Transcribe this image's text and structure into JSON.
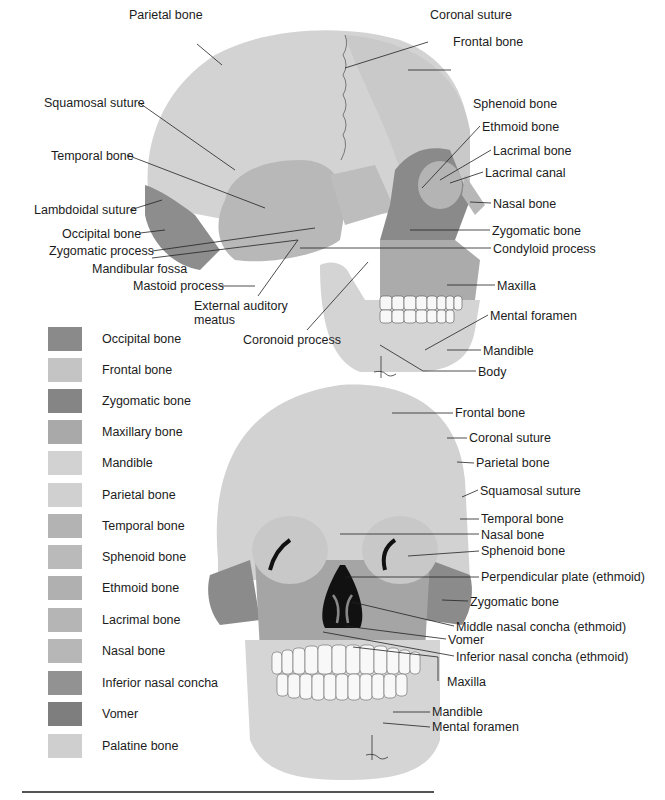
{
  "lateral_view": {
    "labels": [
      {
        "text": "Parietal bone",
        "x": 129,
        "y": 36
      },
      {
        "text": "Coronal suture",
        "x": 430,
        "y": 36
      },
      {
        "text": "Frontal bone",
        "x": 453,
        "y": 63
      },
      {
        "text": "Squamosal suture",
        "x": 44,
        "y": 96
      },
      {
        "text": "Sphenoid bone",
        "x": 473,
        "y": 97
      },
      {
        "text": "Ethmoid bone",
        "x": 482,
        "y": 120
      },
      {
        "text": "Temporal bone",
        "x": 51,
        "y": 149
      },
      {
        "text": "Lacrimal bone",
        "x": 493,
        "y": 144
      },
      {
        "text": "Lacrimal canal",
        "x": 485,
        "y": 166
      },
      {
        "text": "Lambdoidal suture",
        "x": 34,
        "y": 204
      },
      {
        "text": "Nasal bone",
        "x": 493,
        "y": 197
      },
      {
        "text": "Occipital bone",
        "x": 62,
        "y": 228
      },
      {
        "text": "Zygomatic bone",
        "x": 492,
        "y": 224
      },
      {
        "text": "Zygomatic process",
        "x": 49,
        "y": 245
      },
      {
        "text": "Condyloid process",
        "x": 493,
        "y": 242
      },
      {
        "text": "Mandibular fossa",
        "x": 92,
        "y": 263
      },
      {
        "text": "Mastoid process",
        "x": 133,
        "y": 280
      },
      {
        "text": "External auditory",
        "x": 194,
        "y": 300
      },
      {
        "text": "meatus",
        "x": 194,
        "y": 315
      },
      {
        "text": "Maxilla",
        "x": 497,
        "y": 279
      },
      {
        "text": "Mental foramen",
        "x": 490,
        "y": 309
      },
      {
        "text": "Coronoid process",
        "x": 243,
        "y": 333
      },
      {
        "text": "Mandible",
        "x": 483,
        "y": 344
      },
      {
        "text": "Body",
        "x": 478,
        "y": 365
      }
    ]
  },
  "frontal_view": {
    "labels": [
      {
        "text": "Frontal bone",
        "x": 455,
        "y": 406
      },
      {
        "text": "Coronal suture",
        "x": 469,
        "y": 431
      },
      {
        "text": "Parietal bone",
        "x": 476,
        "y": 456
      },
      {
        "text": "Squamosal suture",
        "x": 480,
        "y": 484
      },
      {
        "text": "Temporal bone",
        "x": 481,
        "y": 513
      },
      {
        "text": "Nasal bone",
        "x": 481,
        "y": 528
      },
      {
        "text": "Sphenoid bone",
        "x": 481,
        "y": 545
      },
      {
        "text": "Perpendicular plate (ethmoid)",
        "x": 481,
        "y": 571
      },
      {
        "text": "Zygomatic bone",
        "x": 470,
        "y": 595
      },
      {
        "text": "Middle nasal concha (ethmoid)",
        "x": 456,
        "y": 620
      },
      {
        "text": "Vomer",
        "x": 448,
        "y": 633
      },
      {
        "text": "Inferior nasal concha (ethmoid)",
        "x": 456,
        "y": 650
      },
      {
        "text": "Maxilla",
        "x": 447,
        "y": 675
      },
      {
        "text": "Mandible",
        "x": 432,
        "y": 705
      },
      {
        "text": "Mental foramen",
        "x": 432,
        "y": 720
      }
    ]
  },
  "legend": {
    "items": [
      {
        "label": "Occipital bone",
        "color": "#8a8a8a"
      },
      {
        "label": "Frontal bone",
        "color": "#c4c4c4"
      },
      {
        "label": "Zygomatic bone",
        "color": "#858585"
      },
      {
        "label": "Maxillary bone",
        "color": "#a9a9a9"
      },
      {
        "label": "Mandible",
        "color": "#d2d2d2"
      },
      {
        "label": "Parietal bone",
        "color": "#d0d0d0"
      },
      {
        "label": "Temporal bone",
        "color": "#b3b3b3"
      },
      {
        "label": "Sphenoid bone",
        "color": "#bababa"
      },
      {
        "label": "Ethmoid bone",
        "color": "#b0b0b0"
      },
      {
        "label": "Lacrimal bone",
        "color": "#b5b5b5"
      },
      {
        "label": "Nasal bone",
        "color": "#b7b7b7"
      },
      {
        "label": "Inferior nasal concha",
        "color": "#929292"
      },
      {
        "label": "Vomer",
        "color": "#7e7e7e"
      },
      {
        "label": "Palatine bone",
        "color": "#cfcfcf"
      }
    ]
  }
}
